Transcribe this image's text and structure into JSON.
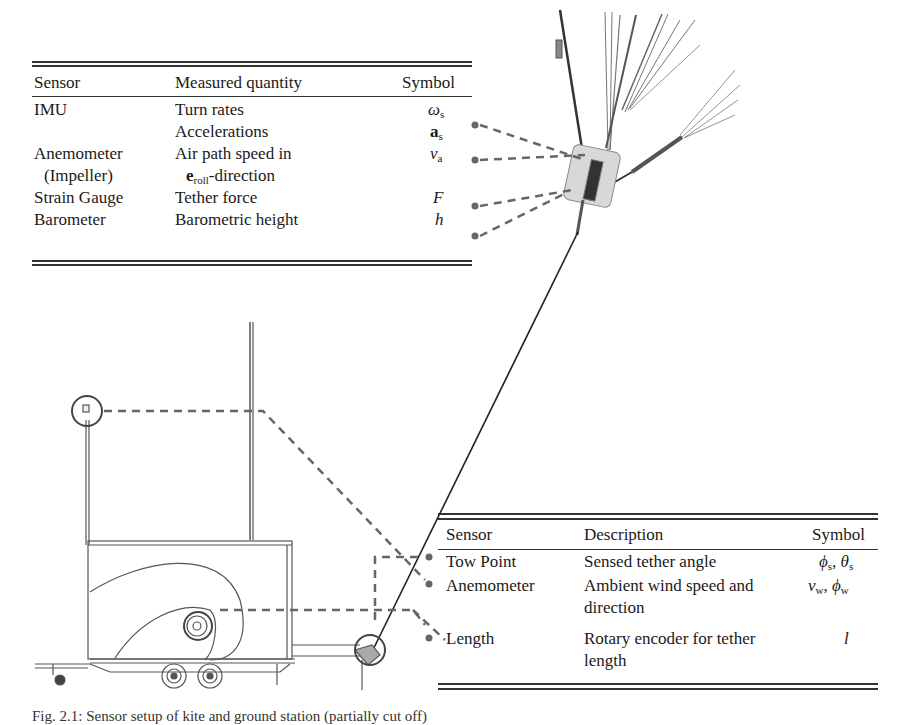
{
  "kite_table": {
    "headers": [
      "Sensor",
      "Measured quantity",
      "Symbol"
    ],
    "rows": [
      {
        "sensor": "IMU",
        "quantity": "Turn rates",
        "symbol_main": "ω",
        "symbol_sub": "s"
      },
      {
        "sensor": "",
        "quantity": "Accelerations",
        "symbol_main": "a",
        "symbol_sub": "s"
      },
      {
        "sensor": "Anemometer",
        "quantity": "Air path speed in",
        "symbol_main": "v",
        "symbol_sub": "a"
      },
      {
        "sensor": "(Impeller)",
        "quantity_bold": "e",
        "quantity_sub": "roll",
        "quantity_rest": "-direction",
        "symbol_main": "",
        "symbol_sub": ""
      },
      {
        "sensor": "Strain Gauge",
        "quantity": "Tether force",
        "symbol_main": "F",
        "symbol_sub": ""
      },
      {
        "sensor": "Barometer",
        "quantity": "Barometric height",
        "symbol_main": "h",
        "symbol_sub": ""
      }
    ]
  },
  "ground_table": {
    "headers": [
      "Sensor",
      "Description",
      "Symbol"
    ],
    "rows": [
      {
        "sensor": "Tow Point",
        "description": "Sensed tether angle",
        "symbol": "ϕs, θs",
        "s1": "ϕ",
        "s1sub": "s",
        "s2": "θ",
        "s2sub": "s"
      },
      {
        "sensor": "Anemometer",
        "description": "Ambient wind speed and",
        "description2": "direction",
        "s1": "v",
        "s1sub": "w",
        "s2": "ϕ",
        "s2sub": "w"
      },
      {
        "sensor": "Length",
        "description": "Rotary encoder for tether",
        "description2": "length",
        "s1": "l",
        "s1sub": "",
        "s2": "",
        "s2sub": ""
      }
    ]
  },
  "caption": {
    "text": "Fig. 2.1: Sensor setup of kite and ground station (partially cut off)"
  },
  "colors": {
    "rule": "#333333",
    "dash": "#666666",
    "drawing": "#444444",
    "dot": "#666666"
  }
}
